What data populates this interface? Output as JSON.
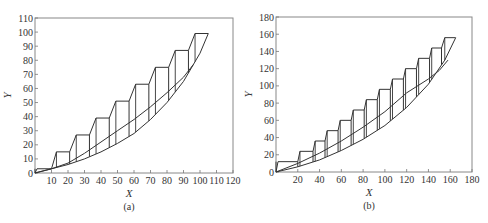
{
  "chart_data": [
    {
      "type": "line",
      "panel": "(a)",
      "title": "",
      "xlabel": "X",
      "ylabel": "Y",
      "xlim": [
        0,
        120
      ],
      "ylim": [
        0,
        110
      ],
      "xticks": [
        10,
        20,
        30,
        40,
        50,
        60,
        70,
        80,
        90,
        100,
        110,
        120
      ],
      "yticks": [
        0,
        10,
        20,
        30,
        40,
        50,
        60,
        70,
        80,
        90,
        100,
        110
      ],
      "grid": false,
      "series": [
        {
          "name": "staircase",
          "steps": [
            {
              "x0": 0,
              "x1": 10,
              "y": 3
            },
            {
              "x0": 13,
              "x1": 21,
              "y": 15
            },
            {
              "x0": 25,
              "x1": 33,
              "y": 27
            },
            {
              "x0": 37,
              "x1": 45,
              "y": 39
            },
            {
              "x0": 49,
              "x1": 57,
              "y": 51
            },
            {
              "x0": 61,
              "x1": 69,
              "y": 63
            },
            {
              "x0": 73,
              "x1": 81,
              "y": 75
            },
            {
              "x0": 85,
              "x1": 93,
              "y": 87
            },
            {
              "x0": 97,
              "x1": 105,
              "y": 99
            }
          ]
        },
        {
          "name": "middle-curve",
          "x": [
            0,
            10,
            20,
            30,
            40,
            50,
            60,
            70,
            80,
            90,
            96
          ],
          "y": [
            0,
            3,
            7,
            14,
            22,
            30,
            38,
            47,
            57,
            68,
            77
          ]
        },
        {
          "name": "lower-curve",
          "x": [
            0,
            10,
            20,
            30,
            40,
            50,
            60,
            70,
            80,
            90,
            100,
            105
          ],
          "y": [
            0,
            3,
            6,
            10,
            15,
            21,
            28,
            38,
            50,
            65,
            85,
            99
          ]
        }
      ],
      "caption": "(a)"
    },
    {
      "type": "line",
      "panel": "(b)",
      "title": "",
      "xlabel": "X",
      "ylabel": "Y",
      "xlim": [
        0,
        180
      ],
      "ylim": [
        0,
        180
      ],
      "xticks": [
        20,
        40,
        60,
        80,
        100,
        120,
        140,
        160,
        180
      ],
      "yticks": [
        0,
        20,
        40,
        60,
        80,
        100,
        120,
        140,
        160,
        180
      ],
      "grid": false,
      "series": [
        {
          "name": "staircase",
          "steps": [
            {
              "x0": 0,
              "x1": 20,
              "y": 12
            },
            {
              "x0": 22,
              "x1": 34,
              "y": 24
            },
            {
              "x0": 36,
              "x1": 45,
              "y": 36
            },
            {
              "x0": 47,
              "x1": 57,
              "y": 48
            },
            {
              "x0": 59,
              "x1": 69,
              "y": 60
            },
            {
              "x0": 71,
              "x1": 81,
              "y": 72
            },
            {
              "x0": 83,
              "x1": 93,
              "y": 84
            },
            {
              "x0": 95,
              "x1": 105,
              "y": 96
            },
            {
              "x0": 107,
              "x1": 117,
              "y": 108
            },
            {
              "x0": 119,
              "x1": 129,
              "y": 120
            },
            {
              "x0": 131,
              "x1": 141,
              "y": 132
            },
            {
              "x0": 143,
              "x1": 152,
              "y": 144
            },
            {
              "x0": 155,
              "x1": 165,
              "y": 156
            }
          ]
        },
        {
          "name": "middle-curve",
          "x": [
            0,
            20,
            40,
            60,
            80,
            100,
            120,
            140,
            150,
            158
          ],
          "y": [
            0,
            10,
            22,
            36,
            52,
            70,
            92,
            108,
            118,
            130
          ]
        },
        {
          "name": "lower-curve",
          "x": [
            0,
            20,
            40,
            60,
            80,
            100,
            120,
            140,
            155,
            165
          ],
          "y": [
            0,
            6,
            14,
            25,
            38,
            54,
            75,
            102,
            130,
            156
          ]
        }
      ],
      "caption": "(b)"
    }
  ],
  "labels": {
    "a": {
      "xlabel": "X",
      "ylabel": "Y",
      "caption": "(a)",
      "yticks": [
        "0",
        "10",
        "20",
        "30",
        "40",
        "50",
        "60",
        "70",
        "80",
        "90",
        "100",
        "110"
      ],
      "xticks": [
        "10",
        "20",
        "30",
        "40",
        "50",
        "60",
        "70",
        "80",
        "90",
        "100",
        "110",
        "120"
      ]
    },
    "b": {
      "xlabel": "X",
      "ylabel": "Y",
      "caption": "(b)",
      "yticks": [
        "0",
        "20",
        "40",
        "60",
        "80",
        "100",
        "120",
        "140",
        "160",
        "180"
      ],
      "xticks": [
        "20",
        "40",
        "60",
        "80",
        "100",
        "120",
        "140",
        "160",
        "180"
      ]
    }
  }
}
